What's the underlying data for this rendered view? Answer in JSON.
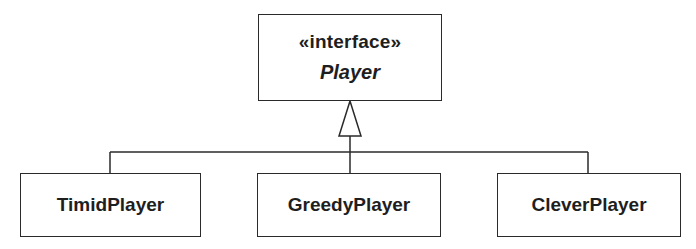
{
  "diagram": {
    "type": "uml-class-diagram",
    "relationship": "realization",
    "interface": {
      "stereotype": "«interface»",
      "name": "Player"
    },
    "implementations": [
      {
        "name": "TimidPlayer"
      },
      {
        "name": "GreedyPlayer"
      },
      {
        "name": "CleverPlayer"
      }
    ],
    "colors": {
      "line": "#2a2a2a",
      "background": "#ffffff",
      "text": "#1e1e1e"
    }
  }
}
